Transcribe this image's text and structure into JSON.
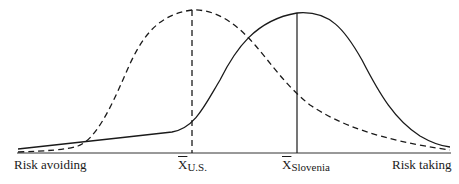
{
  "diagram": {
    "type": "distribution-comparison",
    "axis": {
      "left_label": "Risk avoiding",
      "right_label": "Risk taking"
    },
    "curves": [
      {
        "name": "U.S.",
        "style": "dashed",
        "mean_label": "X",
        "mean_subscript": "U.S."
      },
      {
        "name": "Slovenia",
        "style": "solid",
        "mean_label": "X",
        "mean_subscript": "Slovenia"
      }
    ],
    "colors": {
      "line": "#1a1a1a",
      "background": "#ffffff"
    }
  }
}
